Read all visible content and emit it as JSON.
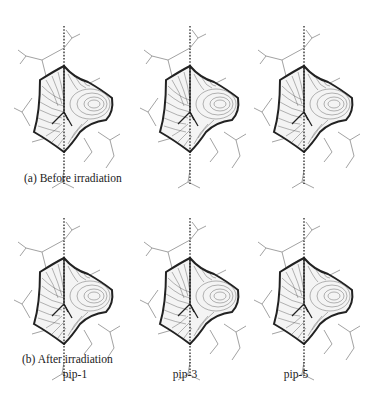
{
  "figure": {
    "rows": [
      {
        "caption": "(a) Before irradiation",
        "panels": [
          {
            "id": "a-pip-1",
            "description": "contour surface plot, before irradiation, pip-1"
          },
          {
            "id": "a-pip-3",
            "description": "contour surface plot, before irradiation, pip-3"
          },
          {
            "id": "a-pip-5",
            "description": "contour surface plot, before irradiation, pip-5"
          }
        ]
      },
      {
        "caption": "(b) After irradiation",
        "panels": [
          {
            "id": "b-pip-1",
            "description": "contour surface plot, after irradiation, pip-1"
          },
          {
            "id": "b-pip-3",
            "description": "contour surface plot, after irradiation, pip-3"
          },
          {
            "id": "b-pip-5",
            "description": "contour surface plot, after irradiation, pip-5"
          }
        ]
      }
    ],
    "column_labels": [
      "pip-1",
      "pip-3",
      "pip-5"
    ],
    "colors": {
      "contour": "#333333",
      "outline": "#222222",
      "wireframe": "#777777",
      "axis_dotted": "#111111"
    }
  }
}
